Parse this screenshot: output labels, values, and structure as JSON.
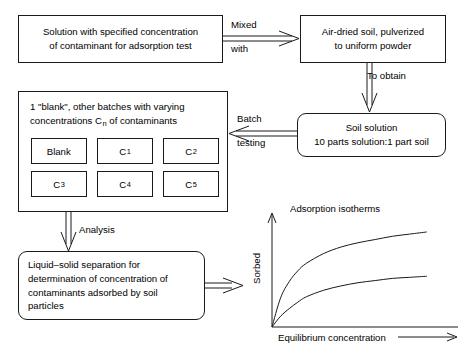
{
  "diagram": {
    "background_color": "#ffffff",
    "line_color": "#1a1a1a"
  },
  "boxes": {
    "solution": {
      "lines": [
        "Solution with specified concentration",
        "of contaminant for adsorption test"
      ]
    },
    "air_dried_soil": {
      "lines": [
        "Air-dried soil, pulverized",
        "to uniform powder"
      ]
    },
    "soil_solution": {
      "lines": [
        "Soil solution",
        "10 parts solution:1 part soil"
      ]
    },
    "liquid_solid_separation": {
      "lines": [
        "Liquid–solid separation for",
        "determination of concentration of",
        "contaminants adsorbed by soil",
        "particles"
      ]
    }
  },
  "batch_container": {
    "header_line_1": "1 \"blank\", other batches with varying",
    "header_line_2_prefix": "concentrations C",
    "header_line_2_subscript": "n",
    "header_line_2_suffix": " of contaminants",
    "vials": [
      {
        "label": "Blank",
        "subscript": ""
      },
      {
        "label": "C",
        "subscript": "1"
      },
      {
        "label": "C",
        "subscript": "2"
      },
      {
        "label": "C",
        "subscript": "3"
      },
      {
        "label": "C",
        "subscript": "4"
      },
      {
        "label": "C",
        "subscript": "5"
      }
    ]
  },
  "arrow_labels": {
    "mixed": "Mixed",
    "with": "with",
    "to_obtain": "To obtain",
    "batch": "Batch",
    "testing": "testing",
    "analysis": "Analysis"
  },
  "chart_data": {
    "type": "line",
    "title": "Adsorption isotherms",
    "xlabel": "Equilibrium concentration",
    "ylabel": "Sorbed",
    "grid": false,
    "legend": "none",
    "axis_arrows": {
      "x": true,
      "y": true
    },
    "xlim": [
      0,
      1
    ],
    "ylim": [
      0,
      1
    ],
    "x": [
      0,
      0.05,
      0.1,
      0.15,
      0.2,
      0.3,
      0.4,
      0.5,
      0.6,
      0.7,
      0.8,
      0.9
    ],
    "series": [
      {
        "name": "upper isotherm",
        "values": [
          0,
          0.27,
          0.42,
          0.52,
          0.59,
          0.68,
          0.74,
          0.78,
          0.81,
          0.84,
          0.86,
          0.88
        ]
      },
      {
        "name": "lower isotherm",
        "values": [
          0,
          0.1,
          0.17,
          0.23,
          0.28,
          0.34,
          0.38,
          0.41,
          0.43,
          0.45,
          0.46,
          0.47
        ]
      }
    ]
  }
}
